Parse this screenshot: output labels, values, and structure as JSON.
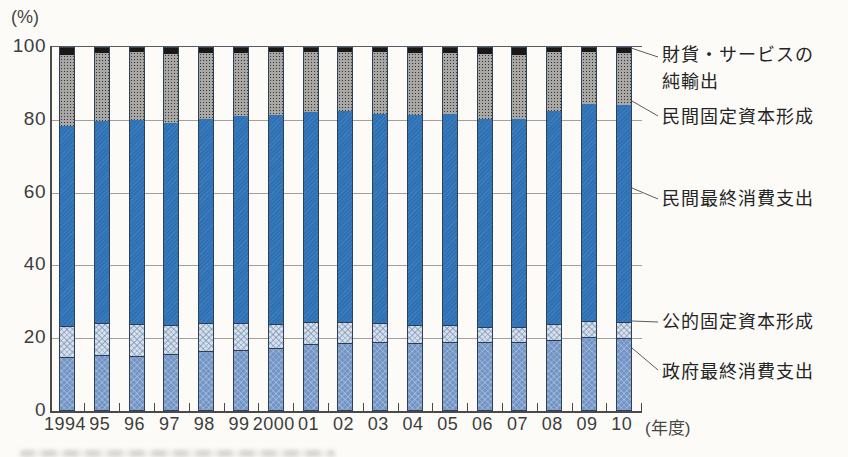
{
  "figure_title": "日本のGDP支出構成比の推移(積み上げ棒グラフ)",
  "chart_data": {
    "type": "bar",
    "stacked": true,
    "unit": "%",
    "grid": true,
    "legend_position": "right",
    "ylim": [
      0,
      100
    ],
    "y_ticks": [
      0,
      20,
      40,
      60,
      80,
      100
    ],
    "y_axis_label": "(%)",
    "x_axis_label": "(年度)",
    "categories": [
      "1994",
      "95",
      "96",
      "97",
      "98",
      "99",
      "2000",
      "01",
      "02",
      "03",
      "04",
      "05",
      "06",
      "07",
      "08",
      "09",
      "10"
    ],
    "series": [
      {
        "key": "government_consumption",
        "name": "政府最終消費支出",
        "color": "#7295c6",
        "values": [
          14.6,
          15.3,
          14.8,
          15.5,
          16.2,
          16.6,
          17.2,
          18.3,
          18.6,
          18.7,
          18.5,
          18.7,
          18.7,
          18.7,
          19.4,
          20.1,
          19.9
        ]
      },
      {
        "key": "public_fixed",
        "name": "公的固定資本形成",
        "color": "#d4dfec",
        "values": [
          8.7,
          8.7,
          9.0,
          8.1,
          7.8,
          7.4,
          6.6,
          6.1,
          5.6,
          5.3,
          5.0,
          4.8,
          4.3,
          4.3,
          4.4,
          4.6,
          4.5
        ]
      },
      {
        "key": "private_consumption",
        "name": "民間最終消費支出",
        "color": "#2e72b5",
        "values": [
          55.2,
          55.8,
          56.3,
          55.7,
          56.4,
          57.2,
          57.7,
          57.9,
          58.3,
          57.9,
          57.9,
          58.3,
          57.5,
          57.3,
          58.7,
          59.8,
          59.8
        ]
      },
      {
        "key": "private_fixed",
        "name": "民間固定資本形成",
        "color": "#8f8f8f",
        "values": [
          19.7,
          18.8,
          18.9,
          19.0,
          18.1,
          17.5,
          17.4,
          16.5,
          16.3,
          16.9,
          17.3,
          16.7,
          17.8,
          17.9,
          16.5,
          14.3,
          14.4
        ]
      },
      {
        "key": "net_exports",
        "name": "財貨・サービスの純輸出",
        "color": "#181818",
        "values": [
          1.8,
          1.4,
          1.0,
          1.7,
          1.5,
          1.3,
          1.1,
          1.2,
          1.2,
          1.2,
          1.3,
          1.5,
          1.7,
          1.8,
          1.0,
          1.2,
          1.4
        ]
      }
    ]
  },
  "legend": {
    "net_exports_line1": "財貨・サービスの",
    "net_exports_line2": "純輸出",
    "private_fixed": "民間固定資本形成",
    "private_consumption": "民間最終消費支出",
    "public_fixed": "公的固定資本形成",
    "government_consumption": "政府最終消費支出"
  }
}
